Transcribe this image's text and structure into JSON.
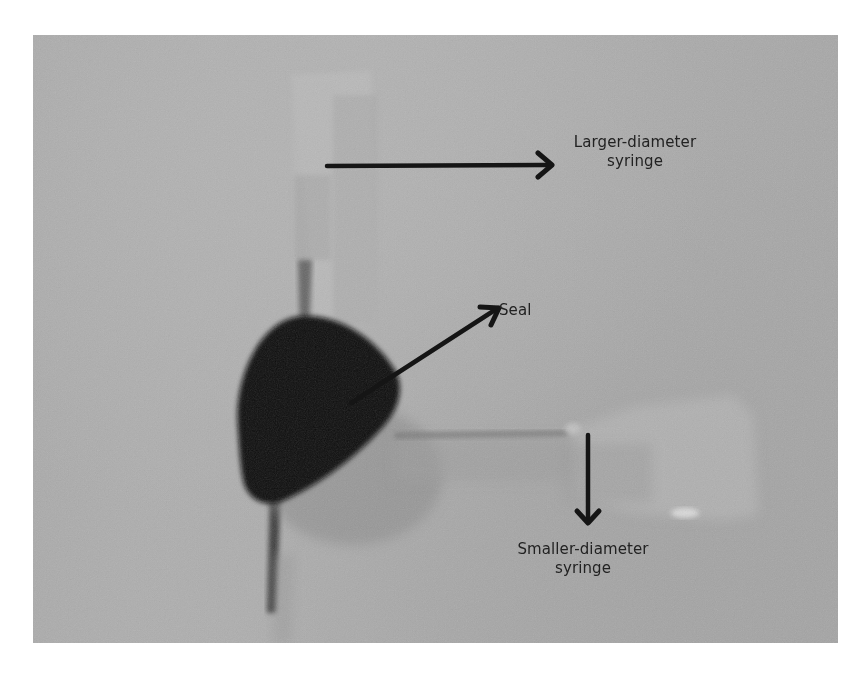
{
  "figure": {
    "type": "annotated-photograph",
    "colors": {
      "background": "#acacac",
      "seal": "#111111",
      "arrow": "#151515",
      "label_text": "#222222"
    },
    "annotations": [
      {
        "id": "larger-syringe",
        "lines": [
          "Larger-diameter",
          "syringe"
        ],
        "arrow_direction": "right"
      },
      {
        "id": "seal",
        "lines": [
          "Seal"
        ],
        "arrow_direction": "up-right"
      },
      {
        "id": "smaller-syringe",
        "lines": [
          "Smaller-diameter",
          "syringe"
        ],
        "arrow_direction": "down"
      }
    ]
  }
}
